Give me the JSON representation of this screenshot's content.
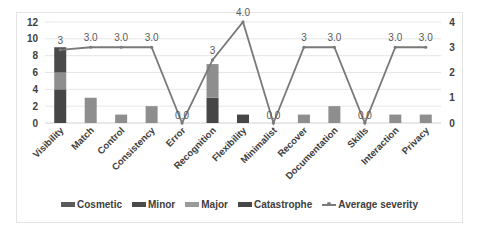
{
  "chart_data": {
    "type": "bar",
    "subtype": "stacked bar with line on secondary axis",
    "title": "",
    "xlabel": "",
    "ylabel": "",
    "categories": [
      "Visibility",
      "Match",
      "Control",
      "Consistency",
      "Error",
      "Recognition",
      "Flexibility",
      "Minimalist",
      "Recover",
      "Documentation",
      "Skills",
      "Interaction",
      "Privacy"
    ],
    "series": [
      {
        "name": "Cosmetic",
        "type": "bar",
        "axis": "left",
        "color": "#5a5a5a",
        "values": [
          0,
          0,
          0,
          0,
          0,
          0,
          0,
          0,
          0,
          0,
          0,
          0,
          0
        ]
      },
      {
        "name": "Minor",
        "type": "bar",
        "axis": "left",
        "color": "#4a4a4a",
        "values": [
          3,
          0,
          0,
          0,
          0,
          0,
          0,
          0,
          0,
          0,
          0,
          0,
          0
        ]
      },
      {
        "name": "Major",
        "type": "bar",
        "axis": "left",
        "color": "#8e8e8e",
        "values": [
          2,
          3,
          1,
          2,
          0,
          4,
          0,
          0,
          1,
          2,
          0,
          1,
          1
        ]
      },
      {
        "name": "Catastrophe",
        "type": "bar",
        "axis": "left",
        "color": "#464646",
        "values": [
          4,
          0,
          0,
          0,
          0,
          3,
          1,
          0,
          0,
          0,
          0,
          0,
          0
        ]
      },
      {
        "name": "Average severity",
        "type": "line",
        "axis": "right",
        "color": "#7a7a7a",
        "values": [
          2.9,
          3.0,
          3.0,
          3.0,
          0.0,
          2.5,
          4.0,
          0.0,
          3.0,
          3.0,
          0.0,
          3.0,
          3.0
        ]
      }
    ],
    "data_labels": [
      "3",
      "3.0",
      "3.0",
      "3.0",
      "0.0",
      "3",
      "4.0",
      "0.0",
      "3",
      "3.0",
      "0.0",
      "3.0",
      "3.0"
    ],
    "ylim": [
      0,
      12
    ],
    "yticks": [
      0,
      2,
      4,
      6,
      8,
      10,
      12
    ],
    "y2lim": [
      0,
      4
    ],
    "y2ticks": [
      0,
      1,
      2,
      3,
      4
    ],
    "grid": true,
    "legend_position": "bottom"
  },
  "legend": [
    {
      "label": "Cosmetic",
      "kind": "box",
      "color": "#5a5a5a"
    },
    {
      "label": "Minor",
      "kind": "box",
      "color": "#4a4a4a"
    },
    {
      "label": "Major",
      "kind": "box",
      "color": "#9a9a9a"
    },
    {
      "label": "Catastrophe",
      "kind": "box",
      "color": "#464646"
    },
    {
      "label": "Average severity",
      "kind": "line",
      "color": "#7a7a7a"
    }
  ]
}
